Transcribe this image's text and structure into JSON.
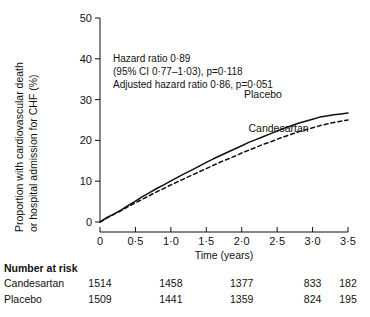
{
  "chart_data": {
    "type": "line",
    "title": "",
    "xlabel": "Time (years)",
    "ylabel_line1": "Proportion with cardiovascular death",
    "ylabel_line2": "or hospital admission for CHF (%)",
    "xlim": [
      0,
      3.5
    ],
    "ylim": [
      0,
      50
    ],
    "xticks": [
      0,
      0.5,
      1.0,
      1.5,
      2.0,
      2.5,
      3.0,
      3.5
    ],
    "xtick_labels": [
      "0",
      "0·5",
      "1·0",
      "1·5",
      "2·0",
      "2·5",
      "3·0",
      "3·5"
    ],
    "yticks": [
      0,
      10,
      20,
      30,
      40,
      50
    ],
    "ytick_labels": [
      "0",
      "10",
      "20",
      "30",
      "40",
      "50"
    ],
    "grid": false,
    "legend_position": "inline-curve-labels",
    "series": [
      {
        "name": "Placebo",
        "style": "solid",
        "color": "#111111",
        "label_x": 2.3,
        "label_y": 30.5,
        "x": [
          0,
          0.1,
          0.2,
          0.3,
          0.4,
          0.5,
          0.6,
          0.7,
          0.8,
          0.9,
          1.0,
          1.1,
          1.2,
          1.3,
          1.4,
          1.5,
          1.6,
          1.7,
          1.8,
          1.9,
          2.0,
          2.1,
          2.2,
          2.3,
          2.4,
          2.5,
          2.6,
          2.7,
          2.8,
          2.9,
          3.0,
          3.1,
          3.2,
          3.3,
          3.4,
          3.5
        ],
        "y": [
          0,
          1.1,
          2.0,
          3.0,
          4.1,
          5.1,
          6.2,
          7.2,
          8.2,
          9.1,
          10.1,
          11.0,
          11.9,
          12.8,
          13.7,
          14.6,
          15.5,
          16.3,
          17.1,
          17.9,
          18.7,
          19.5,
          20.2,
          20.9,
          21.6,
          22.3,
          23.0,
          23.6,
          24.2,
          24.7,
          25.2,
          25.7,
          26.0,
          26.3,
          26.5,
          26.7
        ]
      },
      {
        "name": "Candesartan",
        "style": "dashed",
        "color": "#111111",
        "label_x": 2.52,
        "label_y": 22.0,
        "x": [
          0,
          0.1,
          0.2,
          0.3,
          0.4,
          0.5,
          0.6,
          0.7,
          0.8,
          0.9,
          1.0,
          1.1,
          1.2,
          1.3,
          1.4,
          1.5,
          1.6,
          1.7,
          1.8,
          1.9,
          2.0,
          2.1,
          2.2,
          2.3,
          2.4,
          2.5,
          2.6,
          2.7,
          2.8,
          2.9,
          3.0,
          3.1,
          3.2,
          3.3,
          3.4,
          3.5
        ],
        "y": [
          0,
          1.0,
          1.9,
          2.8,
          3.8,
          4.7,
          5.6,
          6.5,
          7.4,
          8.2,
          9.1,
          9.9,
          10.7,
          11.5,
          12.3,
          13.1,
          13.9,
          14.7,
          15.4,
          16.1,
          16.9,
          17.6,
          18.3,
          19.0,
          19.6,
          20.3,
          20.9,
          21.5,
          22.1,
          22.6,
          23.1,
          23.6,
          24.0,
          24.4,
          24.7,
          25.0
        ]
      }
    ],
    "annotations": [
      "Hazard ratio 0·89",
      "(95% CI 0·77–1·03), p=0·118",
      "Adjusted hazard ratio 0·86, p=0·051"
    ]
  },
  "risk_table": {
    "title": "Number at risk",
    "column_times": [
      0,
      1.0,
      2.0,
      3.0,
      3.5
    ],
    "rows": [
      {
        "label": "Candesartan",
        "values": [
          "1514",
          "1458",
          "1377",
          "833",
          "182"
        ]
      },
      {
        "label": "Placebo",
        "values": [
          "1509",
          "1441",
          "1359",
          "824",
          "195"
        ]
      }
    ]
  }
}
